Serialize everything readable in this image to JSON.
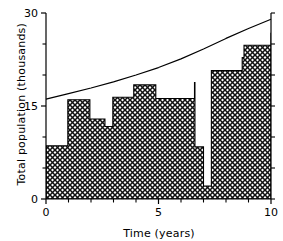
{
  "chart_data": {
    "type": "area",
    "title": "",
    "xlabel": "Time (years)",
    "ylabel": "Total population (thousands)",
    "xlim": [
      0,
      10
    ],
    "ylim": [
      0,
      30
    ],
    "xticks": [
      0,
      5,
      10
    ],
    "xticklabels": [
      "0",
      "5",
      "10"
    ],
    "xminorticks": [
      1,
      2,
      3,
      4,
      6,
      7,
      8,
      9
    ],
    "yticks": [
      0,
      15,
      30
    ],
    "yticklabels": [
      "0",
      "15",
      "30"
    ],
    "yminorticks": [
      5,
      10,
      20,
      25
    ],
    "grid": false,
    "legend": null,
    "series": [
      {
        "name": "Total population (harvested stock)",
        "style": "step-hatched-area",
        "fill": "cross-hatch",
        "points": [
          {
            "x": 0.0,
            "y": 8.6
          },
          {
            "x": 0.97,
            "y": 8.6
          },
          {
            "x": 0.97,
            "y": 16.0
          },
          {
            "x": 1.95,
            "y": 16.0
          },
          {
            "x": 1.95,
            "y": 12.9
          },
          {
            "x": 2.62,
            "y": 12.9
          },
          {
            "x": 2.62,
            "y": 11.7
          },
          {
            "x": 2.97,
            "y": 11.7
          },
          {
            "x": 2.97,
            "y": 16.4
          },
          {
            "x": 3.9,
            "y": 16.4
          },
          {
            "x": 3.9,
            "y": 18.4
          },
          {
            "x": 4.88,
            "y": 18.4
          },
          {
            "x": 4.88,
            "y": 16.2
          },
          {
            "x": 6.6,
            "y": 16.2
          },
          {
            "x": 6.6,
            "y": 18.8
          },
          {
            "x": 6.62,
            "y": 18.8
          },
          {
            "x": 6.62,
            "y": 8.4
          },
          {
            "x": 7.0,
            "y": 8.4
          },
          {
            "x": 7.0,
            "y": 2.1
          },
          {
            "x": 7.35,
            "y": 2.1
          },
          {
            "x": 7.35,
            "y": 20.7
          },
          {
            "x": 8.72,
            "y": 20.7
          },
          {
            "x": 8.72,
            "y": 22.8
          },
          {
            "x": 8.8,
            "y": 22.8
          },
          {
            "x": 8.8,
            "y": 24.8
          },
          {
            "x": 10.0,
            "y": 24.8
          },
          {
            "x": 10.0,
            "y": 26.8
          }
        ]
      },
      {
        "name": "Carrying capacity envelope",
        "style": "line",
        "x": [
          0.0,
          1.0,
          2.0,
          3.0,
          4.0,
          5.0,
          6.0,
          7.0,
          8.0,
          9.0,
          10.0
        ],
        "y": [
          16.1,
          17.0,
          17.9,
          18.9,
          20.0,
          21.2,
          22.6,
          24.2,
          25.9,
          27.5,
          29.0
        ]
      }
    ],
    "colors": {
      "axis": "#000000",
      "line": "#000000",
      "hatch": "#1a1a1a",
      "background": "#ffffff"
    }
  }
}
